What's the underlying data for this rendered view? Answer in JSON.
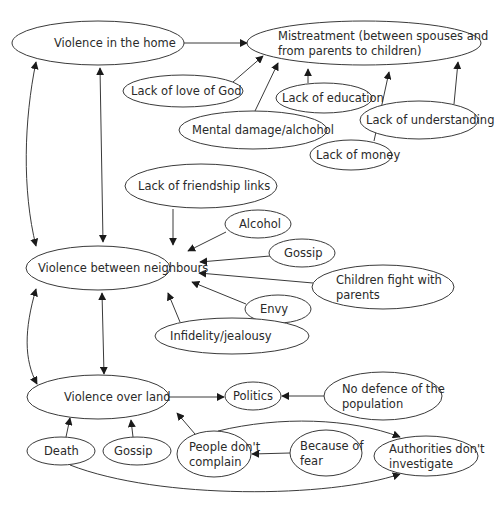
{
  "diagram": {
    "type": "cause-effect map",
    "nodes": [
      {
        "id": "violence_home",
        "lines": [
          "Violence in the home"
        ],
        "cx": 98,
        "cy": 43,
        "rx": 86,
        "ry": 22,
        "tx": 54
      },
      {
        "id": "mistreatment",
        "lines": [
          "Mistreatment (between spouses and",
          "from parents to children)"
        ],
        "cx": 364,
        "cy": 43,
        "rx": 117,
        "ry": 22,
        "tx": 278
      },
      {
        "id": "lack_love_god",
        "lines": [
          "Lack of love of God"
        ],
        "cx": 183,
        "cy": 91,
        "rx": 60,
        "ry": 16,
        "tx": 131
      },
      {
        "id": "lack_education",
        "lines": [
          "Lack of education"
        ],
        "cx": 324,
        "cy": 98,
        "rx": 48,
        "ry": 15,
        "tx": 282
      },
      {
        "id": "mental_damage",
        "lines": [
          "Mental damage/alchohol"
        ],
        "cx": 253,
        "cy": 130,
        "rx": 74,
        "ry": 19,
        "tx": 192
      },
      {
        "id": "lack_understanding",
        "lines": [
          "Lack of understanding"
        ],
        "cx": 419,
        "cy": 120,
        "rx": 59,
        "ry": 19,
        "tx": 366
      },
      {
        "id": "lack_money",
        "lines": [
          "Lack of money"
        ],
        "cx": 351,
        "cy": 155,
        "rx": 41,
        "ry": 15,
        "tx": 316
      },
      {
        "id": "lack_friendship",
        "lines": [
          "Lack of friendship links"
        ],
        "cx": 201,
        "cy": 186,
        "rx": 76,
        "ry": 22,
        "tx": 138
      },
      {
        "id": "alcohol",
        "lines": [
          "Alcohol"
        ],
        "cx": 258,
        "cy": 224,
        "rx": 33,
        "ry": 14,
        "tx": 239
      },
      {
        "id": "gossip_1",
        "lines": [
          "Gossip"
        ],
        "cx": 302,
        "cy": 253,
        "rx": 33,
        "ry": 14,
        "tx": 284
      },
      {
        "id": "violence_neighbours",
        "lines": [
          "Violence between neighbours"
        ],
        "cx": 98,
        "cy": 268,
        "rx": 72,
        "ry": 22,
        "tx": 38
      },
      {
        "id": "children_fight",
        "lines": [
          "Children fight with",
          "parents"
        ],
        "cx": 383,
        "cy": 287,
        "rx": 71,
        "ry": 22,
        "tx": 336
      },
      {
        "id": "envy",
        "lines": [
          "Envy"
        ],
        "cx": 278,
        "cy": 309,
        "rx": 33,
        "ry": 14,
        "tx": 260
      },
      {
        "id": "infidelity",
        "lines": [
          "Infidelity/jealousy"
        ],
        "cx": 232,
        "cy": 336,
        "rx": 77,
        "ry": 18,
        "tx": 170
      },
      {
        "id": "violence_land",
        "lines": [
          "Violence over land"
        ],
        "cx": 98,
        "cy": 397,
        "rx": 71,
        "ry": 22,
        "tx": 64
      },
      {
        "id": "politics",
        "lines": [
          "Politics"
        ],
        "cx": 253,
        "cy": 396,
        "rx": 28,
        "ry": 14,
        "tx": 233
      },
      {
        "id": "no_defence",
        "lines": [
          "No defence of the",
          "population"
        ],
        "cx": 383,
        "cy": 396,
        "rx": 59,
        "ry": 24,
        "tx": 342
      },
      {
        "id": "death",
        "lines": [
          "Death"
        ],
        "cx": 61,
        "cy": 451,
        "rx": 34,
        "ry": 14,
        "tx": 44
      },
      {
        "id": "gossip_2",
        "lines": [
          "Gossip"
        ],
        "cx": 137,
        "cy": 451,
        "rx": 34,
        "ry": 14,
        "tx": 114
      },
      {
        "id": "people_dont_complain",
        "lines": [
          "People don't",
          "complain"
        ],
        "cx": 214,
        "cy": 454,
        "rx": 37,
        "ry": 23,
        "tx": 189
      },
      {
        "id": "because_fear",
        "lines": [
          "Because of",
          "fear"
        ],
        "cx": 326,
        "cy": 453,
        "rx": 36,
        "ry": 23,
        "tx": 300
      },
      {
        "id": "authorities",
        "lines": [
          "Authorities don't",
          "investigate"
        ],
        "cx": 426,
        "cy": 456,
        "rx": 52,
        "ry": 20,
        "tx": 389
      }
    ],
    "edges": [
      {
        "from": "violence_home",
        "to": "mistreatment",
        "d": "M184,43 L247,43",
        "start": false,
        "end": true
      },
      {
        "from": "lack_love_god",
        "to": "mistreatment",
        "d": "M233,82 L263,56",
        "start": false,
        "end": true
      },
      {
        "from": "mental_damage",
        "to": "mistreatment",
        "d": "M255,111 L278,63",
        "start": false,
        "end": true
      },
      {
        "from": "lack_education",
        "to": "mistreatment",
        "d": "M308,83 L308,69",
        "start": false,
        "end": true
      },
      {
        "from": "lack_money",
        "to": "mistreatment",
        "d": "M374,141 L389,72",
        "start": false,
        "end": true
      },
      {
        "from": "lack_understanding",
        "to": "mistreatment",
        "d": "M454,104 L458,62",
        "start": false,
        "end": true
      },
      {
        "from": "violence_home",
        "to": "violence_neighbours",
        "d": "M36,62 C24,120 22,190 36,246",
        "start": true,
        "end": true
      },
      {
        "from": "violence_home",
        "to": "violence_neighbours",
        "d": "M100,68 L103,242",
        "start": true,
        "end": true
      },
      {
        "from": "lack_friendship",
        "to": "violence_neighbours",
        "d": "M173,209 L173,245",
        "start": false,
        "end": true
      },
      {
        "from": "alcohol",
        "to": "violence_neighbours",
        "d": "M226,232 L188,251",
        "start": false,
        "end": true
      },
      {
        "from": "gossip_1",
        "to": "violence_neighbours",
        "d": "M270,256 L200,262",
        "start": false,
        "end": true
      },
      {
        "from": "children_fight",
        "to": "violence_neighbours",
        "d": "M313,283 L199,273",
        "start": false,
        "end": true
      },
      {
        "from": "envy",
        "to": "violence_neighbours",
        "d": "M246,304 L192,282",
        "start": false,
        "end": true
      },
      {
        "from": "infidelity",
        "to": "violence_neighbours",
        "d": "M180,322 L168,293",
        "start": false,
        "end": true
      },
      {
        "from": "violence_neighbours",
        "to": "violence_land",
        "d": "M36,289 C24,330 24,360 37,384",
        "start": true,
        "end": true
      },
      {
        "from": "violence_neighbours",
        "to": "violence_land",
        "d": "M102,293 L104,374",
        "start": true,
        "end": true
      },
      {
        "from": "violence_land",
        "to": "politics",
        "d": "M169,397 L224,397",
        "start": false,
        "end": true
      },
      {
        "from": "no_defence",
        "to": "politics",
        "d": "M324,396 L282,396",
        "start": false,
        "end": true
      },
      {
        "from": "death",
        "to": "violence_land",
        "d": "M66,437 L70,418",
        "start": false,
        "end": true
      },
      {
        "from": "gossip_2",
        "to": "violence_land",
        "d": "M133,437 L131,420",
        "start": false,
        "end": true
      },
      {
        "from": "people_dont_complain",
        "to": "violence_land",
        "d": "M195,434 L177,413",
        "start": false,
        "end": true
      },
      {
        "from": "because_fear",
        "to": "people_dont_complain",
        "d": "M290,453 L252,454",
        "start": false,
        "end": true
      },
      {
        "from": "people_dont_complain",
        "to": "authorities",
        "d": "M218,431 C280,416 350,418 400,437",
        "start": false,
        "end": true
      },
      {
        "from": "death",
        "to": "authorities",
        "d": "M70,465 C160,500 330,498 400,474",
        "start": false,
        "end": true
      }
    ]
  }
}
